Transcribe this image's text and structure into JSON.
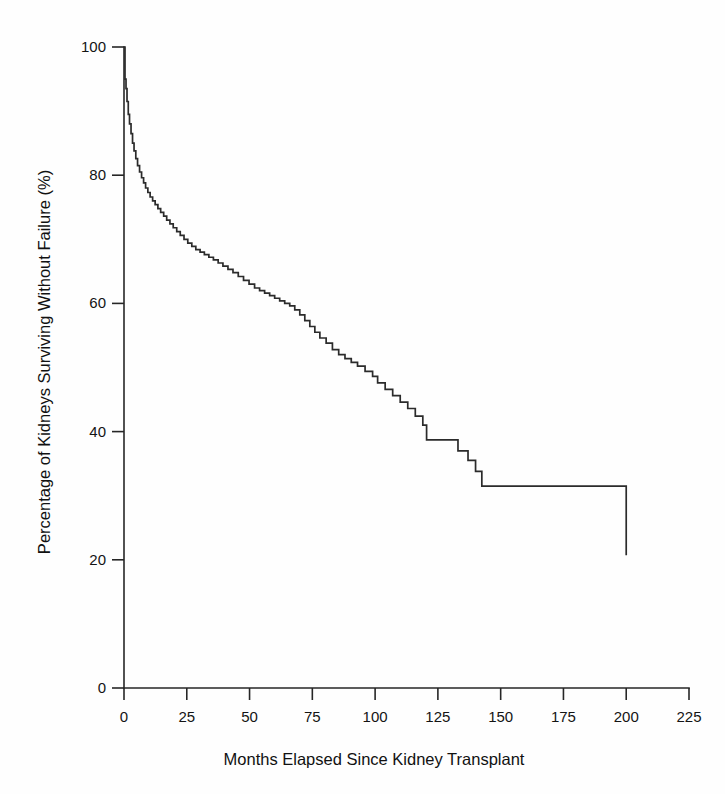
{
  "chart_data": {
    "type": "line",
    "title": "",
    "subtitle": "",
    "xlabel": "Months Elapsed Since Kidney Transplant",
    "ylabel": "Percentage of Kidneys Surviving Without Failure (%)",
    "xlim": [
      0,
      225
    ],
    "ylim": [
      0,
      100
    ],
    "xticks": [
      0,
      25,
      50,
      75,
      100,
      125,
      150,
      175,
      200,
      225
    ],
    "xtick_labels": [
      "0",
      "25",
      "50",
      "75",
      "100",
      "125",
      "150",
      "175",
      "200",
      "225"
    ],
    "yticks": [
      0,
      20,
      40,
      60,
      80,
      100
    ],
    "ytick_labels": [
      "0",
      "20",
      "40",
      "60",
      "80",
      "100"
    ],
    "grid": false,
    "legend": false,
    "legend_position": "none",
    "line_color": "#2b2b2b",
    "axis_color": "#262626",
    "background_color": "#fefefe",
    "step_type": "post",
    "annotations": [],
    "series": [
      {
        "name": "Kaplan-Meier graft survival",
        "x": [
          0,
          0.4,
          0.8,
          1.2,
          1.7,
          2.2,
          2.8,
          3.4,
          4.0,
          4.7,
          5.4,
          6.2,
          7.0,
          7.8,
          8.6,
          9.5,
          10.4,
          11.4,
          12.4,
          13.5,
          14.6,
          15.8,
          17.0,
          18.3,
          19.6,
          21.0,
          22.4,
          23.9,
          25.4,
          27.0,
          28.6,
          30.3,
          32.0,
          33.8,
          35.6,
          37.5,
          39.4,
          41.4,
          43.4,
          45.5,
          47.6,
          49.8,
          52.0,
          54.0,
          56.0,
          58.0,
          60.0,
          62.0,
          64.0,
          66.0,
          68.0,
          70.0,
          72.0,
          74.0,
          76.0,
          78.0,
          80.5,
          83.0,
          85.5,
          88.0,
          90.5,
          93.0,
          96.0,
          99.0,
          101.0,
          104.0,
          107.0,
          110.0,
          113.0,
          116.0,
          119.0,
          120.5,
          128.0,
          133.0,
          137.0,
          140.0,
          142.5,
          184.5,
          200.0
        ],
        "y": [
          100.0,
          95.0,
          93.5,
          91.5,
          89.5,
          88.0,
          86.5,
          85.0,
          83.8,
          82.6,
          81.5,
          80.5,
          79.6,
          78.8,
          78.0,
          77.3,
          76.6,
          76.0,
          75.4,
          74.8,
          74.2,
          73.6,
          73.0,
          72.4,
          71.8,
          71.2,
          70.6,
          70.0,
          69.4,
          68.9,
          68.4,
          68.0,
          67.6,
          67.2,
          66.8,
          66.3,
          65.8,
          65.3,
          64.8,
          64.2,
          63.6,
          63.0,
          62.4,
          62.0,
          61.6,
          61.2,
          60.8,
          60.4,
          60.0,
          59.6,
          59.0,
          58.2,
          57.3,
          56.4,
          55.5,
          54.6,
          53.8,
          52.8,
          52.0,
          51.4,
          50.8,
          50.2,
          49.4,
          48.6,
          47.6,
          46.6,
          45.6,
          44.6,
          43.6,
          42.4,
          41.0,
          38.7,
          38.7,
          37.0,
          35.5,
          33.8,
          31.5,
          31.5,
          20.7
        ]
      }
    ],
    "key_points": {
      "start_percent": 100,
      "end_percent": 20.7,
      "final_month": 200,
      "plateau_percent": 31.5,
      "plateau_start_month": 142.5,
      "plateau_end_month": 184.5
    }
  }
}
